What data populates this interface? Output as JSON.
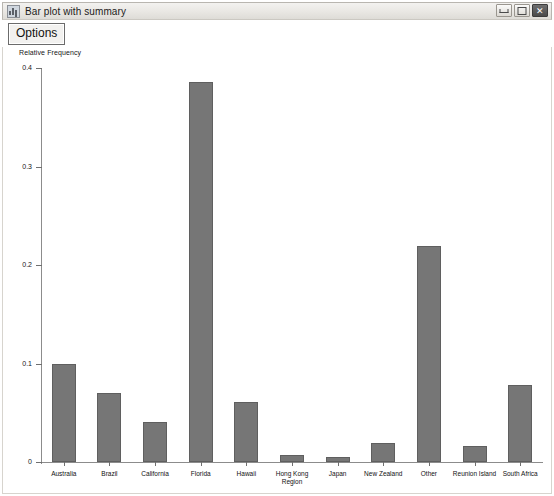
{
  "window": {
    "title": "Bar plot with summary",
    "icon": "chart-window-icon",
    "controls": {
      "minimize": "minimize-icon",
      "maximize": "maximize-icon",
      "close": "✕"
    }
  },
  "toolbar": {
    "options_label": "Options"
  },
  "chart_data": {
    "type": "bar",
    "title": "",
    "xlabel": "",
    "ylabel": "Relative Frequency",
    "categories": [
      "Australia",
      "Brazil",
      "California",
      "Florida",
      "Hawaii",
      "Hong Kong\nRegion",
      "Japan",
      "New Zealand",
      "Other",
      "Reunion Island",
      "South Africa"
    ],
    "values": [
      0.099,
      0.07,
      0.041,
      0.386,
      0.061,
      0.007,
      0.005,
      0.019,
      0.219,
      0.016,
      0.078
    ],
    "ylim": [
      0,
      0.4
    ],
    "yticks": [
      0,
      0.1,
      0.2,
      0.3,
      0.4
    ],
    "ytick_labels": [
      "0",
      "0.1",
      "0.2",
      "0.3",
      "0.4"
    ],
    "grid": false,
    "legend": "none",
    "bar_color": "#767676",
    "bar_edge_color": "#5f5f5f",
    "axis_color": "#8c8c8c",
    "background": "#ffffff"
  }
}
